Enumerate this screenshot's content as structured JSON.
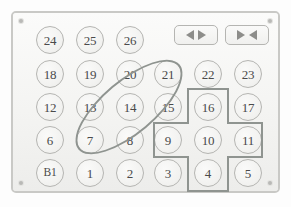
{
  "panel": {
    "name": "numeric-keypad-panel",
    "corner_screws": 4,
    "colors": {
      "panel_face": "#f6f6f4",
      "panel_border": "#c9c9c6",
      "key_border": "#b5b5b2",
      "key_face": "#f2f2f0",
      "label_text": "#4a4a4a",
      "annotation_stroke": "#8f9490",
      "arrow_glyph": "#8d8d8a"
    }
  },
  "keys": [
    {
      "id": "key-24",
      "label": "24",
      "row": 0,
      "col": 0,
      "x": 48,
      "y": 38
    },
    {
      "id": "key-25",
      "label": "25",
      "row": 0,
      "col": 1,
      "x": 88,
      "y": 38
    },
    {
      "id": "key-26",
      "label": "26",
      "row": 0,
      "col": 2,
      "x": 128,
      "y": 38
    },
    {
      "id": "key-18",
      "label": "18",
      "row": 1,
      "col": 0,
      "x": 48,
      "y": 72
    },
    {
      "id": "key-19",
      "label": "19",
      "row": 1,
      "col": 1,
      "x": 88,
      "y": 72
    },
    {
      "id": "key-20",
      "label": "20",
      "row": 1,
      "col": 2,
      "x": 128,
      "y": 72
    },
    {
      "id": "key-21",
      "label": "21",
      "row": 1,
      "col": 3,
      "x": 166,
      "y": 72
    },
    {
      "id": "key-22",
      "label": "22",
      "row": 1,
      "col": 4,
      "x": 206,
      "y": 72
    },
    {
      "id": "key-23",
      "label": "23",
      "row": 1,
      "col": 5,
      "x": 246,
      "y": 72
    },
    {
      "id": "key-12",
      "label": "12",
      "row": 2,
      "col": 0,
      "x": 48,
      "y": 105
    },
    {
      "id": "key-13",
      "label": "13",
      "row": 2,
      "col": 1,
      "x": 88,
      "y": 105
    },
    {
      "id": "key-14",
      "label": "14",
      "row": 2,
      "col": 2,
      "x": 128,
      "y": 105
    },
    {
      "id": "key-15",
      "label": "15",
      "row": 2,
      "col": 3,
      "x": 166,
      "y": 105
    },
    {
      "id": "key-16",
      "label": "16",
      "row": 2,
      "col": 4,
      "x": 206,
      "y": 105
    },
    {
      "id": "key-17",
      "label": "17",
      "row": 2,
      "col": 5,
      "x": 246,
      "y": 105
    },
    {
      "id": "key-6",
      "label": "6",
      "row": 3,
      "col": 0,
      "x": 48,
      "y": 138
    },
    {
      "id": "key-7",
      "label": "7",
      "row": 3,
      "col": 1,
      "x": 88,
      "y": 138
    },
    {
      "id": "key-8",
      "label": "8",
      "row": 3,
      "col": 2,
      "x": 128,
      "y": 138
    },
    {
      "id": "key-9",
      "label": "9",
      "row": 3,
      "col": 3,
      "x": 166,
      "y": 138
    },
    {
      "id": "key-10",
      "label": "10",
      "row": 3,
      "col": 4,
      "x": 206,
      "y": 138
    },
    {
      "id": "key-11",
      "label": "11",
      "row": 3,
      "col": 5,
      "x": 246,
      "y": 138
    },
    {
      "id": "key-b1",
      "label": "B1",
      "row": 4,
      "col": 0,
      "x": 48,
      "y": 171
    },
    {
      "id": "key-1",
      "label": "1",
      "row": 4,
      "col": 1,
      "x": 88,
      "y": 171
    },
    {
      "id": "key-2",
      "label": "2",
      "row": 4,
      "col": 2,
      "x": 128,
      "y": 171
    },
    {
      "id": "key-3",
      "label": "3",
      "row": 4,
      "col": 3,
      "x": 166,
      "y": 171
    },
    {
      "id": "key-4",
      "label": "4",
      "row": 4,
      "col": 4,
      "x": 206,
      "y": 171
    },
    {
      "id": "key-5",
      "label": "5",
      "row": 4,
      "col": 5,
      "x": 246,
      "y": 171
    }
  ],
  "arrow_buttons": [
    {
      "id": "open-doors-button",
      "icon": "arrows-outward-icon",
      "glyph_left": "◀",
      "glyph_right": "▶",
      "direction": "outward",
      "x": 194,
      "y": 33
    },
    {
      "id": "close-doors-button",
      "icon": "arrows-inward-icon",
      "glyph_left": "▶",
      "glyph_right": "◀",
      "direction": "inward",
      "x": 245,
      "y": 33
    }
  ],
  "annotations": [
    {
      "id": "ellipse-highlight",
      "shape": "ellipse",
      "covers": [
        "7",
        "14",
        "21"
      ],
      "center_x": 127,
      "center_y": 105,
      "width": 132,
      "height": 54,
      "rotation_deg": -40
    },
    {
      "id": "cross-highlight",
      "shape": "plus-cross",
      "covers": [
        "16",
        "9",
        "10",
        "11",
        "4"
      ],
      "center_x": 206,
      "center_y": 138,
      "arm_span_x": 108,
      "arm_span_y": 102
    }
  ]
}
